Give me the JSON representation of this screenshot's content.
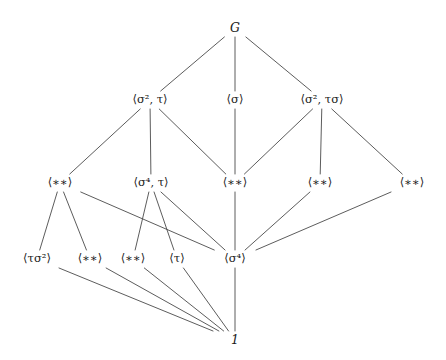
{
  "figure": {
    "kind": "subgroup-lattice-hasse-diagram",
    "background_color": "#ffffff",
    "line_color": "#4a4a4a",
    "text_color": "#1a1a1a",
    "width": 446,
    "height": 360
  },
  "chart_data": {
    "type": "diagram",
    "title": "",
    "nodes": [
      {
        "id": "G",
        "label": "G",
        "x": 235,
        "y": 28,
        "level": 0
      },
      {
        "id": "A1",
        "label": "⟨σ², τ⟩",
        "x": 150,
        "y": 100,
        "level": 1
      },
      {
        "id": "A2",
        "label": "⟨σ⟩",
        "x": 235,
        "y": 100,
        "level": 1
      },
      {
        "id": "A3",
        "label": "⟨σ², τσ⟩",
        "x": 322,
        "y": 100,
        "level": 1
      },
      {
        "id": "B1",
        "label": "⟨∗∗⟩",
        "x": 60,
        "y": 183,
        "level": 2
      },
      {
        "id": "B2",
        "label": "⟨σ⁴, τ⟩",
        "x": 151,
        "y": 183,
        "level": 2
      },
      {
        "id": "B3",
        "label": "⟨∗∗⟩",
        "x": 235,
        "y": 183,
        "level": 2
      },
      {
        "id": "B4",
        "label": "⟨∗∗⟩",
        "x": 320,
        "y": 183,
        "level": 2
      },
      {
        "id": "B5",
        "label": "⟨∗∗⟩",
        "x": 412,
        "y": 183,
        "level": 2
      },
      {
        "id": "C1",
        "label": "⟨τσ²⟩",
        "x": 37,
        "y": 259,
        "level": 3
      },
      {
        "id": "C2",
        "label": "⟨∗∗⟩",
        "x": 90,
        "y": 259,
        "level": 3
      },
      {
        "id": "C3",
        "label": "⟨∗∗⟩",
        "x": 133,
        "y": 259,
        "level": 3
      },
      {
        "id": "C4",
        "label": "⟨τ⟩",
        "x": 177,
        "y": 259,
        "level": 3
      },
      {
        "id": "C5",
        "label": "⟨σ⁴⟩",
        "x": 235,
        "y": 259,
        "level": 3
      },
      {
        "id": "ONE",
        "label": "1",
        "x": 235,
        "y": 340,
        "level": 4
      }
    ],
    "edges": [
      {
        "from": "G",
        "to": "A1"
      },
      {
        "from": "G",
        "to": "A2"
      },
      {
        "from": "G",
        "to": "A3"
      },
      {
        "from": "A1",
        "to": "B1"
      },
      {
        "from": "A1",
        "to": "B2"
      },
      {
        "from": "A1",
        "to": "B3"
      },
      {
        "from": "A2",
        "to": "B3"
      },
      {
        "from": "A3",
        "to": "B3"
      },
      {
        "from": "A3",
        "to": "B4"
      },
      {
        "from": "A3",
        "to": "B5"
      },
      {
        "from": "B1",
        "to": "C1"
      },
      {
        "from": "B1",
        "to": "C2"
      },
      {
        "from": "B1",
        "to": "C5"
      },
      {
        "from": "B2",
        "to": "C3"
      },
      {
        "from": "B2",
        "to": "C4"
      },
      {
        "from": "B2",
        "to": "C5"
      },
      {
        "from": "B3",
        "to": "C5"
      },
      {
        "from": "B4",
        "to": "C5"
      },
      {
        "from": "B5",
        "to": "C5"
      },
      {
        "from": "C1",
        "to": "ONE"
      },
      {
        "from": "C2",
        "to": "ONE"
      },
      {
        "from": "C3",
        "to": "ONE"
      },
      {
        "from": "C4",
        "to": "ONE"
      },
      {
        "from": "C5",
        "to": "ONE"
      }
    ]
  },
  "labels": {
    "top": "G",
    "bottom": "1",
    "row1": [
      "⟨σ², τ⟩",
      "⟨σ⟩",
      "⟨σ², τσ⟩"
    ],
    "row2": [
      "⟨∗∗⟩",
      "⟨σ⁴, τ⟩",
      "⟨∗∗⟩",
      "⟨∗∗⟩",
      "⟨∗∗⟩"
    ],
    "row3": [
      "⟨τσ²⟩",
      "⟨∗∗⟩",
      "⟨∗∗⟩",
      "⟨τ⟩",
      "⟨σ⁴⟩"
    ]
  }
}
